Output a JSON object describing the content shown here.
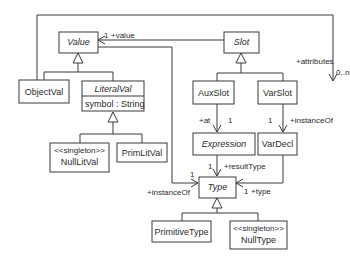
{
  "diagram": {
    "type": "UML class diagram",
    "classes": {
      "value": {
        "name": "Value",
        "abstract": true
      },
      "slot": {
        "name": "Slot",
        "abstract": true
      },
      "object_val": {
        "name": "ObjectVal",
        "abstract": false
      },
      "literal_val": {
        "name": "LiteralVal",
        "abstract": true,
        "attribute": "symbol : String"
      },
      "null_lit_val": {
        "stereotype": "<<singleton>>",
        "name": "NullLitVal",
        "abstract": false
      },
      "prim_lit_val": {
        "name": "PrimLitVal",
        "abstract": false
      },
      "aux_slot": {
        "name": "AuxSlot",
        "abstract": false
      },
      "var_slot": {
        "name": "VarSlot",
        "abstract": false
      },
      "expression": {
        "name": "Expression",
        "abstract": true
      },
      "var_decl": {
        "name": "VarDecl",
        "abstract": false
      },
      "type": {
        "name": "Type",
        "abstract": true
      },
      "primitive_type": {
        "name": "PrimitiveType",
        "abstract": false
      },
      "null_type": {
        "stereotype": "<<singleton>>",
        "name": "NullType",
        "abstract": false
      }
    },
    "associations": {
      "slot_value": {
        "from": "Slot",
        "to": "Value",
        "multiplicity": "1",
        "role": "+value"
      },
      "objectval_attributes": {
        "from": "ObjectVal",
        "to": "VarSlot",
        "role": "+attributes",
        "multiplicity": "0..n"
      },
      "auxslot_at": {
        "from": "AuxSlot",
        "to": "Expression",
        "role": "+at",
        "multiplicity": "1"
      },
      "varslot_instanceof": {
        "from": "VarSlot",
        "to": "VarDecl",
        "multiplicity": "1",
        "role": "+instanceOf"
      },
      "expression_resulttype": {
        "from": "Expression",
        "to": "Type",
        "multiplicity": "1",
        "role": "+resultType"
      },
      "value_instanceof": {
        "from": "Value",
        "to": "Type",
        "multiplicity": "1",
        "role": "+instanceOf"
      },
      "vardecl_type": {
        "from": "VarDecl",
        "to": "Type",
        "multiplicity": "1",
        "role": "+type"
      }
    },
    "generalizations": [
      {
        "parent": "Value",
        "children": [
          "ObjectVal",
          "LiteralVal"
        ]
      },
      {
        "parent": "LiteralVal",
        "children": [
          "NullLitVal",
          "PrimLitVal"
        ]
      },
      {
        "parent": "Slot",
        "children": [
          "AuxSlot",
          "VarSlot"
        ]
      },
      {
        "parent": "Type",
        "children": [
          "PrimitiveType",
          "NullType"
        ]
      }
    ]
  }
}
